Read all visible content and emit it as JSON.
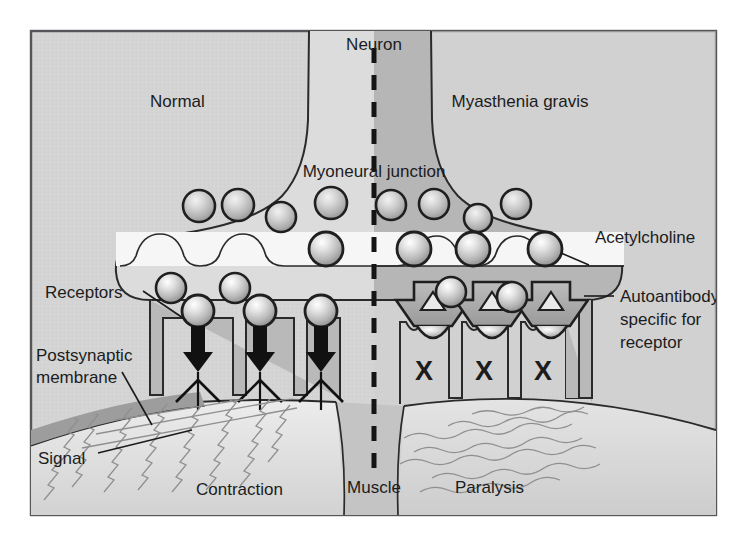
{
  "figure": {
    "frame_border_color": "#55555a",
    "background_color": "#ffffff",
    "panel_background_color": "#d3d3d3"
  },
  "panels": {
    "left": {
      "name": "Normal",
      "label": "Normal",
      "outcome_label": "Contraction",
      "signal_label": "Signal",
      "neuron_fill": "#dcdcdc",
      "muscle_fill": "#dcdcdc",
      "fiber_style": "tight-zigzag"
    },
    "right": {
      "name": "Myasthenia gravis",
      "label": "Myasthenia gravis",
      "outcome_label": "Paralysis",
      "neuron_fill": "#b4b4b4",
      "muscle_fill": "#cdcdcd",
      "fiber_style": "loose-wavy"
    }
  },
  "labels": {
    "neuron": "Neuron",
    "myoneural_junction": "Myoneural junction",
    "acetylcholine": "Acetylcholine",
    "receptors": "Receptors",
    "postsynaptic_membrane": "Postsynaptic\nmembrane",
    "postsynaptic_membrane_line1": "Postsynaptic",
    "postsynaptic_membrane_line2": "membrane",
    "autoantibody_line1": "Autoantibody",
    "autoantibody_line2": "specific for",
    "autoantibody_line3": "receptor",
    "muscle": "Muscle",
    "blocked_receptor_mark": "X"
  },
  "colors": {
    "outline": "#2a2a2a",
    "text": "#1c1c1c",
    "divider": "#141414",
    "cleft_light": "#f4f4f4",
    "terminal_dark": "#a8a8a8",
    "terminal_light": "#c8c8c8",
    "fold_fill": "#b9b9b9",
    "vesicle_edge": "#1f1f1f",
    "arrow": "#111111",
    "membrane_band": "#9f9f9f"
  },
  "elements": {
    "divider": {
      "type": "dashed-line",
      "orientation": "vertical",
      "x": 374
    },
    "vesicles_upper_left": [
      {
        "cx": 199,
        "cy": 206,
        "r": 16
      },
      {
        "cx": 238,
        "cy": 205,
        "r": 16
      },
      {
        "cx": 281,
        "cy": 217,
        "r": 15
      },
      {
        "cx": 331,
        "cy": 203,
        "r": 16
      }
    ],
    "vesicles_upper_right": [
      {
        "cx": 391,
        "cy": 205,
        "r": 15
      },
      {
        "cx": 434,
        "cy": 204,
        "r": 15
      },
      {
        "cx": 478,
        "cy": 217,
        "r": 14
      },
      {
        "cx": 516,
        "cy": 204,
        "r": 15
      }
    ],
    "vesicles_cleft_left": [
      {
        "cx": 326,
        "cy": 249,
        "r": 17
      }
    ],
    "vesicles_cleft_right": [
      {
        "cx": 414,
        "cy": 249,
        "r": 17
      },
      {
        "cx": 473,
        "cy": 249,
        "r": 17
      },
      {
        "cx": 545,
        "cy": 249,
        "r": 17
      }
    ],
    "free_acetylcholine_left": [
      {
        "cx": 171,
        "cy": 288,
        "r": 15
      },
      {
        "cx": 235,
        "cy": 288,
        "r": 15
      }
    ],
    "receptor_spheres_left": [
      {
        "cx": 198,
        "cy": 318,
        "r": 16,
        "docked": true
      },
      {
        "cx": 258,
        "cy": 311,
        "r": 16,
        "docked": true
      },
      {
        "cx": 319,
        "cy": 311,
        "r": 16,
        "docked": true
      }
    ],
    "free_acetylcholine_right": [
      {
        "cx": 451,
        "cy": 291,
        "r": 15
      },
      {
        "cx": 518,
        "cy": 295,
        "r": 15
      }
    ],
    "junction_folds_left": [
      {
        "x": 176,
        "label": "open"
      },
      {
        "x": 237,
        "label": "open"
      },
      {
        "x": 298,
        "label": "open"
      }
    ],
    "junction_folds_right_blocked": [
      {
        "x": 420,
        "mark": "X"
      },
      {
        "x": 479,
        "mark": "X"
      },
      {
        "x": 538,
        "mark": "X"
      }
    ],
    "autoantibodies": [
      {
        "cx": 428,
        "cy": 310
      },
      {
        "cx": 487,
        "cy": 310
      },
      {
        "cx": 546,
        "cy": 310
      }
    ],
    "signal_arrows_left": [
      {
        "x": 198,
        "y_top": 330,
        "y_bottom": 378
      },
      {
        "x": 258,
        "y_top": 330,
        "y_bottom": 378
      },
      {
        "x": 319,
        "y_top": 330,
        "y_bottom": 378
      }
    ]
  }
}
